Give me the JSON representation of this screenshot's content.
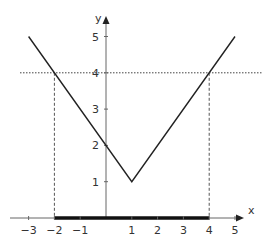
{
  "chart_data": {
    "type": "line",
    "title": "",
    "xlabel": "x",
    "ylabel": "y",
    "xlim": [
      -3.3,
      5.5
    ],
    "ylim": [
      0,
      5.5
    ],
    "grid": false,
    "x_ticks": [
      "−3",
      "−2",
      "−1",
      "1",
      "2",
      "3",
      "4",
      "5"
    ],
    "x_tick_values": [
      -3,
      -2,
      -1,
      1,
      2,
      3,
      4,
      5
    ],
    "y_ticks": [
      "1",
      "2",
      "3",
      "4",
      "5"
    ],
    "y_tick_values": [
      1,
      2,
      3,
      4,
      5
    ],
    "series": [
      {
        "name": "f(x) = |x − 1| + 1",
        "x": [
          -3,
          1,
          5
        ],
        "y": [
          5,
          1,
          5
        ]
      }
    ],
    "annotations": [
      {
        "type": "hline-dotted",
        "y": 4,
        "label": "y = 4"
      },
      {
        "type": "vline-dashed",
        "x": -2,
        "from_y": 0,
        "to_y": 4
      },
      {
        "type": "vline-dashed",
        "x": 4,
        "from_y": 0,
        "to_y": 4
      },
      {
        "type": "interval-on-x-axis",
        "from": -2,
        "to": 4,
        "style": "thick"
      }
    ]
  }
}
